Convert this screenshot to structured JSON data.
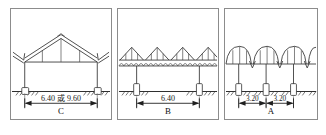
{
  "figure": {
    "type": "engineering-elevation-diagram",
    "background_color": "#ffffff",
    "line_color": "#3a3a3a",
    "panel_border_color": "#8c8c8c",
    "panel_count": 3
  },
  "panels": [
    {
      "id": "panel-c",
      "label": "C",
      "roof_type": "gable-truss",
      "dimension_text": "6.40 或 9.60",
      "spans": [
        "6.40 或 9.60"
      ],
      "bay_count": 1,
      "order": 1
    },
    {
      "id": "panel-b",
      "label": "B",
      "roof_type": "multi-span-gable-truss",
      "dimension_text": "6.40",
      "spans": [
        "6.40"
      ],
      "bay_count": 1,
      "order": 2
    },
    {
      "id": "panel-a",
      "label": "A",
      "roof_type": "multi-span-arch-vault",
      "dimension_text": "3.20",
      "spans": [
        "3.20",
        "3.20"
      ],
      "bay_count": 2,
      "order": 3
    }
  ]
}
